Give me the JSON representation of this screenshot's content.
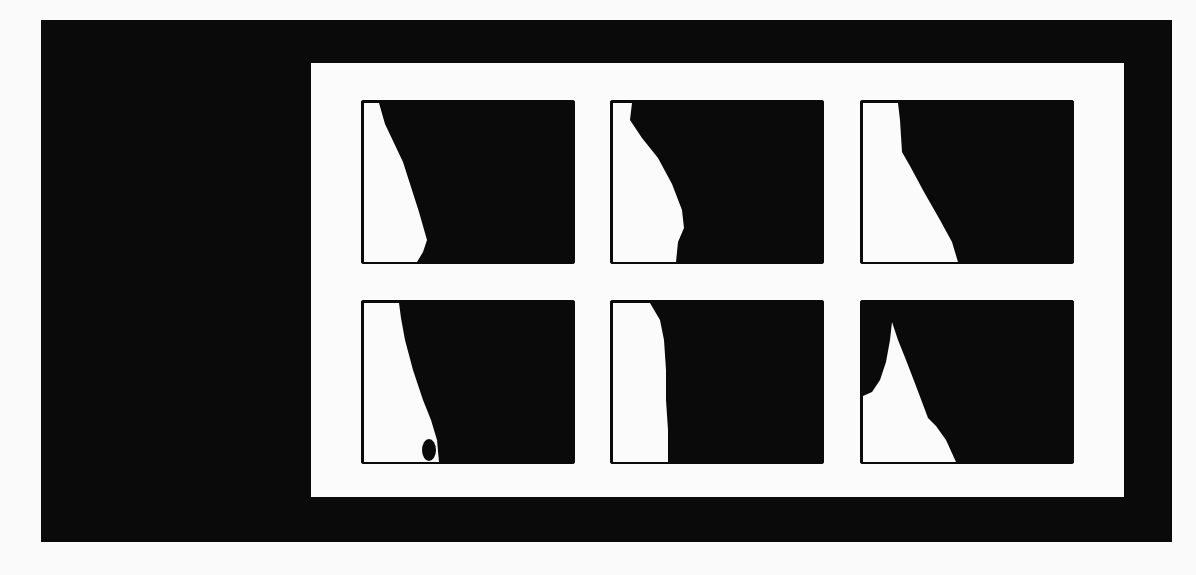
{
  "figure": {
    "colors": {
      "frame": "#0a0a0a",
      "background": "#fbfbfb",
      "foreground": "#0a0a0a"
    },
    "panels": [
      {
        "row": 1,
        "col": 1,
        "label": "panel-1",
        "white_region": "3,3 18,3 24,24 42,62 58,112 66,140 62,152 56,162 3,162"
      },
      {
        "row": 1,
        "col": 2,
        "label": "panel-2",
        "white_region": "3,3 22,3 20,20 32,38 48,58 62,84 72,110 74,128 68,142 66,162 3,162"
      },
      {
        "row": 1,
        "col": 3,
        "label": "panel-3",
        "white_region": "3,3 38,3 40,20 42,52 50,66 64,92 80,120 92,142 98,162 3,162"
      },
      {
        "row": 2,
        "col": 1,
        "label": "panel-4",
        "white_region": "3,3 38,3 40,18 44,40 52,70 62,100 70,120 76,140 78,162 3,162",
        "dark_blob": {
          "cx": 68,
          "cy": 150,
          "rx": 7,
          "ry": 11
        }
      },
      {
        "row": 2,
        "col": 2,
        "label": "panel-5",
        "white_region": "3,3 40,3 50,20 54,40 56,70 56,100 58,130 58,162 3,162"
      },
      {
        "row": 2,
        "col": 3,
        "label": "panel-6",
        "white_region": "3,96 12,92 20,80 26,62 30,40 32,22 38,40 46,60 56,86 62,102 68,118 76,126 86,140 96,162 3,162"
      }
    ]
  }
}
